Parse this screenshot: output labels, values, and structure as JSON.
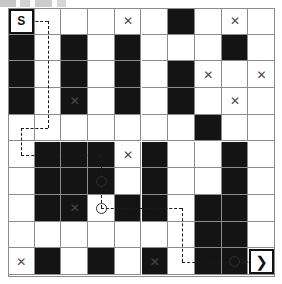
{
  "diagram": {
    "grid": {
      "cols": 10,
      "rows": 10,
      "cell_size": 26.7,
      "origin_x": 8,
      "origin_y": 8,
      "line_color": "#8b8b8b",
      "blocked_color": "#141414",
      "free_color": "#ffffff"
    },
    "start": {
      "label": "S",
      "col": 0,
      "row": 0
    },
    "goal": {
      "label": "❯",
      "col": 9,
      "row": 9
    },
    "blocked_cells": [
      [
        0,
        1
      ],
      [
        2,
        1
      ],
      [
        4,
        1
      ],
      [
        8,
        1
      ],
      [
        0,
        2
      ],
      [
        2,
        2
      ],
      [
        4,
        2
      ],
      [
        6,
        2
      ],
      [
        0,
        3
      ],
      [
        2,
        3
      ],
      [
        4,
        3
      ],
      [
        6,
        3
      ],
      [
        7,
        4
      ],
      [
        1,
        5
      ],
      [
        2,
        5
      ],
      [
        3,
        5
      ],
      [
        5,
        5
      ],
      [
        8,
        5
      ],
      [
        1,
        6
      ],
      [
        2,
        6
      ],
      [
        3,
        6
      ],
      [
        5,
        6
      ],
      [
        8,
        6
      ],
      [
        1,
        7
      ],
      [
        2,
        7
      ],
      [
        4,
        7
      ],
      [
        5,
        7
      ],
      [
        7,
        7
      ],
      [
        8,
        7
      ],
      [
        7,
        8
      ],
      [
        8,
        8
      ],
      [
        1,
        9
      ],
      [
        3,
        9
      ],
      [
        5,
        9
      ],
      [
        7,
        9
      ],
      [
        8,
        9
      ],
      [
        6,
        0
      ]
    ],
    "x_marks": [
      [
        4,
        0
      ],
      [
        8,
        0
      ],
      [
        7,
        2
      ],
      [
        9,
        2
      ],
      [
        2,
        3
      ],
      [
        8,
        3
      ],
      [
        4,
        5
      ],
      [
        2,
        7
      ],
      [
        0,
        9
      ],
      [
        5,
        9
      ]
    ],
    "waypoints": [
      {
        "col": 3,
        "row": 6
      },
      {
        "col": 3,
        "row": 7
      },
      {
        "col": 8,
        "row": 9
      }
    ],
    "path_segments": [
      {
        "orientation": "h",
        "from_col": 0,
        "to_col": 1,
        "row": 0
      },
      {
        "orientation": "v",
        "col": 1,
        "from_row": 0,
        "to_row": 4
      },
      {
        "orientation": "h",
        "from_col": 0,
        "to_col": 1,
        "row": 4
      },
      {
        "orientation": "v",
        "col": 0,
        "from_row": 4,
        "to_row": 5
      },
      {
        "orientation": "h",
        "from_col": 0,
        "to_col": 3,
        "row": 5
      },
      {
        "orientation": "v",
        "col": 3,
        "from_row": 5,
        "to_row": 7
      },
      {
        "orientation": "h",
        "from_col": 3,
        "to_col": 6,
        "row": 7
      },
      {
        "orientation": "v",
        "col": 6,
        "from_row": 7,
        "to_row": 9
      },
      {
        "orientation": "h",
        "from_col": 6,
        "to_col": 9,
        "row": 9
      }
    ],
    "legend": {
      "start_name": "start-cell",
      "goal_name": "goal-cell",
      "blocked_name": "obstacle-cell",
      "x_name": "x-marked-cell",
      "waypoint_name": "path-waypoint",
      "path_name": "planned-path"
    }
  }
}
